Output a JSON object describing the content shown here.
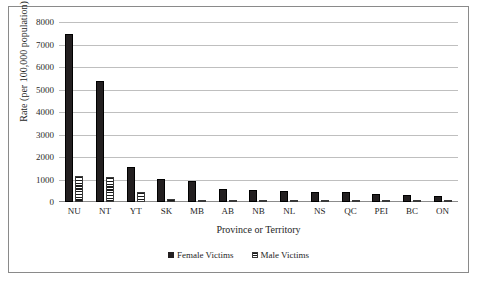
{
  "chart_data": {
    "type": "bar",
    "title": "",
    "xlabel": "Province or Territory",
    "ylabel": "Rate (per 100,000 population)",
    "categories": [
      "NU",
      "NT",
      "YT",
      "SK",
      "MB",
      "AB",
      "NB",
      "NL",
      "NS",
      "QC",
      "PEI",
      "BC",
      "ON"
    ],
    "series": [
      {
        "name": "Female Victims",
        "values": [
          7450,
          5380,
          1560,
          1020,
          930,
          590,
          530,
          470,
          450,
          440,
          370,
          320,
          270
        ]
      },
      {
        "name": "Male Victims",
        "values": [
          1150,
          1120,
          430,
          120,
          100,
          95,
          90,
          80,
          75,
          80,
          65,
          60,
          50
        ]
      }
    ],
    "ylim": [
      0,
      8000
    ],
    "ytick_values": [
      "0",
      "1000",
      "2000",
      "3000",
      "4000",
      "5000",
      "6000",
      "7000",
      "8000"
    ],
    "grid": true,
    "legend_position": "bottom"
  },
  "legend": {
    "items": [
      {
        "label": "Female Victims"
      },
      {
        "label": "Male Victims"
      }
    ]
  }
}
